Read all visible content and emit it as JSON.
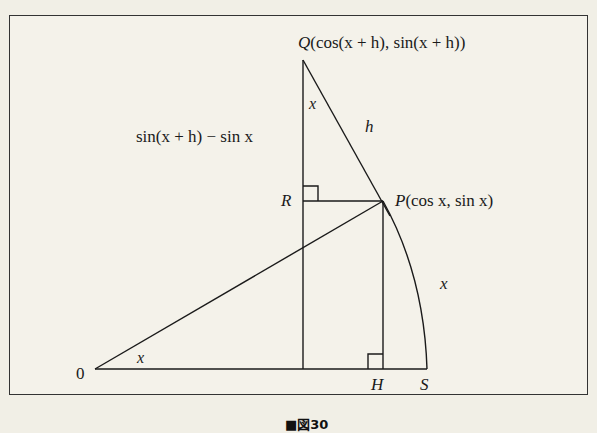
{
  "figure": {
    "caption": "■図30",
    "points": {
      "origin": "0",
      "Q": {
        "name": "Q",
        "coords": "(cos(x + h), sin(x + h))"
      },
      "P": {
        "name": "P",
        "coords": "(cos x, sin x)"
      },
      "R": {
        "name": "R"
      },
      "H": {
        "name": "H"
      },
      "S": {
        "name": "S"
      }
    },
    "labels": {
      "angle_at_origin": "x",
      "angle_at_Q": "x",
      "segment_QP": "h",
      "arc_PS": "x",
      "segment_QR": "sin(x + h) − sin x"
    },
    "colors": {
      "line": "#1a1a1a",
      "background": "#f4f2ea",
      "page": "#f1efe6"
    }
  }
}
